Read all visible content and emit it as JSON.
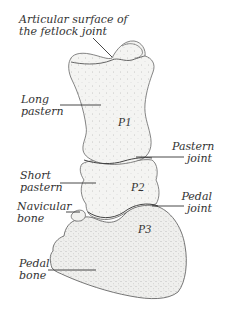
{
  "diagram": {
    "colors": {
      "background": "#ffffff",
      "bone_fill": "#f3f3f1",
      "bone_outline": "#555555",
      "leader_line": "#333333",
      "text": "#333333"
    },
    "labels": [
      {
        "id": "articular-surface",
        "line1": "Articular surface of",
        "line2": "the fetlock joint"
      },
      {
        "id": "long-pastern",
        "line1": "Long",
        "line2": "pastern"
      },
      {
        "id": "pastern-joint",
        "line1": "Pastern",
        "line2": "joint"
      },
      {
        "id": "short-pastern",
        "line1": "Short",
        "line2": "pastern"
      },
      {
        "id": "pedal-joint",
        "line1": "Pedal",
        "line2": "joint"
      },
      {
        "id": "navicular-bone",
        "line1": "Navicular",
        "line2": "bone"
      },
      {
        "id": "pedal-bone",
        "line1": "Pedal",
        "line2": "bone"
      }
    ],
    "bones": [
      {
        "id": "p1",
        "tag": "P1"
      },
      {
        "id": "p2",
        "tag": "P2"
      },
      {
        "id": "p3",
        "tag": "P3"
      }
    ]
  }
}
